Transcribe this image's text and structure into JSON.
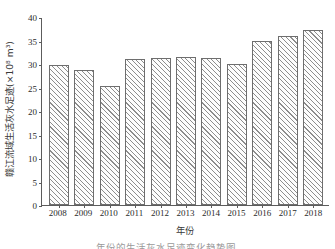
{
  "chart_data": {
    "type": "bar",
    "title": "",
    "subtitle": "",
    "xlabel": "年份",
    "ylabel": "赣江流域生活灰水足迹(×10⁸ m³)",
    "categories": [
      "2008",
      "2009",
      "2010",
      "2011",
      "2012",
      "2013",
      "2014",
      "2015",
      "2016",
      "2017",
      "2018"
    ],
    "values": [
      29.8,
      28.8,
      25.4,
      31.1,
      31.2,
      31.5,
      31.3,
      30.0,
      34.8,
      36.0,
      37.3
    ],
    "series": [
      {
        "name": "赣江流域生活灰水足迹",
        "values": [
          29.8,
          28.8,
          25.4,
          31.1,
          31.2,
          31.5,
          31.3,
          30.0,
          34.8,
          36.0,
          37.3
        ]
      }
    ],
    "ylim": [
      0,
      40
    ],
    "yticks": [
      0,
      5,
      10,
      15,
      20,
      25,
      30,
      35,
      40
    ],
    "ytick_labels": [
      "0",
      "5",
      "10",
      "15",
      "20",
      "25",
      "30",
      "35",
      "40"
    ],
    "grid": false,
    "legend": false,
    "legend_position": "none",
    "bar_fill": "diagonal-hatch",
    "bar_edge_color": "#6e6e6e",
    "bar_hatch_color": "#8d8d8d",
    "axis_color": "#5c5c5c"
  },
  "caption_sliver": "年份的生活灰水足迹变化趋势图"
}
